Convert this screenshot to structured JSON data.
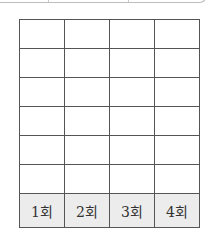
{
  "table": {
    "empty_rows": 6,
    "columns": 4,
    "labels": [
      "1회",
      "2회",
      "3회",
      "4회"
    ]
  }
}
